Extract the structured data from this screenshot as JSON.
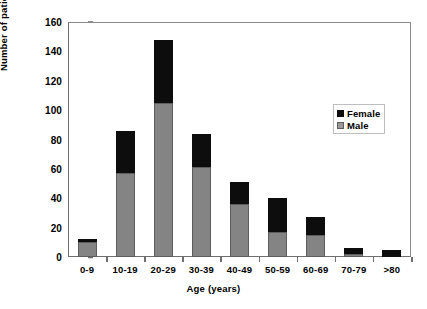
{
  "chart_data": {
    "type": "bar",
    "subtype": "stacked-vertical",
    "title": "",
    "xlabel": "Age (years)",
    "ylabel": "Number of patients",
    "categories": [
      "0-9",
      "10-19",
      "20-29",
      "30-39",
      "40-49",
      "50-59",
      "60-69",
      "70-79",
      ">80"
    ],
    "series": [
      {
        "name": "Male",
        "color": "#848484",
        "values": [
          10,
          57,
          105,
          61,
          36,
          17,
          15,
          2,
          0
        ]
      },
      {
        "name": "Female",
        "color": "#0d0d0d",
        "values": [
          2,
          29,
          43,
          23,
          15,
          23,
          12,
          4,
          5
        ]
      }
    ],
    "totals": [
      12,
      86,
      148,
      84,
      51,
      40,
      27,
      6,
      5
    ],
    "ylim": [
      0,
      160
    ],
    "yticks": [
      0,
      20,
      40,
      60,
      80,
      100,
      120,
      140,
      160
    ],
    "ytick_labels": [
      "0",
      "20",
      "40",
      "60",
      "80",
      "100",
      "120",
      "140",
      "160"
    ],
    "grid": false,
    "legend": {
      "position": "inside-upper-right",
      "entries": [
        {
          "label": "Female",
          "color": "#0d0d0d"
        },
        {
          "label": "Male",
          "color": "#9a9a9a"
        }
      ]
    }
  }
}
